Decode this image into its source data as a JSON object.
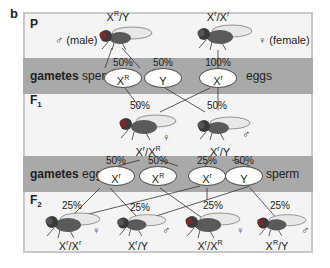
{
  "panel_label": "b",
  "colors": {
    "band": "#a9a9a9",
    "frame_bg": "#f4f4f4",
    "frame_border": "#c9c9c9",
    "fly_body": "#3a3a3a",
    "eye_red": "#7a2a2a"
  },
  "generations": {
    "p": {
      "label": "P"
    },
    "f1": {
      "label": "F",
      "sub": "1"
    },
    "f2": {
      "label": "F",
      "sub": "2"
    }
  },
  "parents": {
    "male": {
      "genotype_base": "X",
      "genotype_sup": "R",
      "genotype_rest": "/Y",
      "sex_label": "♂ (male)"
    },
    "female": {
      "genotype_base": "X",
      "genotype_sup": "r",
      "genotype_rest": "/X",
      "genotype_sup2": "r",
      "sex_label": "♀ (female)"
    }
  },
  "gametes_p": {
    "label_bold": "gametes",
    "sperm_label": "sperm",
    "eggs_label": "eggs",
    "items": [
      {
        "base": "X",
        "sup": "R",
        "pct": "50%"
      },
      {
        "base": "Y",
        "sup": "",
        "pct": "50%"
      },
      {
        "base": "X",
        "sup": "r",
        "pct": "100%"
      }
    ]
  },
  "f1": {
    "female": {
      "pct": "50%",
      "genotype": "X^r/X^R",
      "g1": "X",
      "s1": "r",
      "g2": "/X",
      "s2": "R",
      "sex": "♀"
    },
    "male": {
      "pct": "50%",
      "genotype": "X^r/Y",
      "g1": "X",
      "s1": "r",
      "g2": "/Y",
      "sex": "♂"
    }
  },
  "gametes_f1": {
    "label_bold": "gametes",
    "eggs_label": "eggs",
    "sperm_label": "sperm",
    "items": [
      {
        "base": "X",
        "sup": "r",
        "pct": "50%"
      },
      {
        "base": "X",
        "sup": "R",
        "pct": "50%"
      },
      {
        "base": "X",
        "sup": "r",
        "pct": "25%"
      },
      {
        "base": "Y",
        "sup": "",
        "pct": "50%"
      }
    ]
  },
  "f2": [
    {
      "pct": "25%",
      "g1": "X",
      "s1": "r",
      "g2": "/X",
      "s2": "r",
      "sex": "♀"
    },
    {
      "pct": "25%",
      "g1": "X",
      "s1": "r",
      "g2": "/Y",
      "s2": "",
      "sex": "♂"
    },
    {
      "pct": "25%",
      "g1": "X",
      "s1": "r",
      "g2": "/X",
      "s2": "R",
      "sex": "♀"
    },
    {
      "pct": "25%",
      "g1": "X",
      "s1": "R",
      "g2": "/Y",
      "s2": "",
      "sex": "♂"
    }
  ]
}
